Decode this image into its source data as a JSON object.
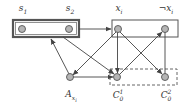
{
  "diagram": {
    "colors": {
      "node_fill": "#b5b5b5",
      "node_stroke": "#555555",
      "edge": "#444444",
      "box": "#555555",
      "background": "#ffffff"
    },
    "labels": {
      "s1": "s",
      "s1_sub": "1",
      "s2": "s",
      "s2_sub": "2",
      "xi": "x",
      "xi_sub": "i",
      "not_xi": "¬x",
      "not_xi_sub": "i",
      "a_xi": "A",
      "a_xi_sub": "x",
      "a_xi_subsub": "i",
      "c01": "C",
      "c01_sub": "0",
      "c01_sup": "1",
      "c02": "C",
      "c02_sub": "0",
      "c02_sup": "2"
    },
    "nodes": [
      {
        "id": "s1",
        "x": 22,
        "y": 29
      },
      {
        "id": "s2",
        "x": 69,
        "y": 29
      },
      {
        "id": "xi",
        "x": 118,
        "y": 29
      },
      {
        "id": "not_xi",
        "x": 165,
        "y": 29
      },
      {
        "id": "A_xi",
        "x": 70,
        "y": 77
      },
      {
        "id": "C0_1",
        "x": 117,
        "y": 77
      },
      {
        "id": "C0_2",
        "x": 165,
        "y": 77
      }
    ],
    "groups": [
      {
        "id": "s-box",
        "style": "double-solid",
        "members": [
          "s1",
          "s2"
        ]
      },
      {
        "id": "x-box",
        "style": "solid",
        "members": [
          "xi",
          "not_xi"
        ]
      },
      {
        "id": "c-box",
        "style": "dashed",
        "members": [
          "C0_1",
          "C0_2"
        ]
      }
    ],
    "edges": [
      {
        "from": "s-box",
        "to": "x-box",
        "directed": true
      },
      {
        "from": "A_xi",
        "to": "s-box",
        "directed": true
      },
      {
        "from": "s-box",
        "to": "C0_1",
        "directed": true
      },
      {
        "from": "A_xi",
        "to": "C0_1",
        "directed": true
      },
      {
        "from": "xi",
        "to": "A_xi",
        "directed": true
      },
      {
        "from": "xi",
        "to": "C0_1",
        "directed": true
      },
      {
        "from": "xi",
        "to": "C0_2",
        "directed": true
      },
      {
        "from": "C0_1",
        "to": "not_xi",
        "directed": true
      },
      {
        "from": "not_xi",
        "to": "C0_2",
        "directed": false
      }
    ]
  }
}
